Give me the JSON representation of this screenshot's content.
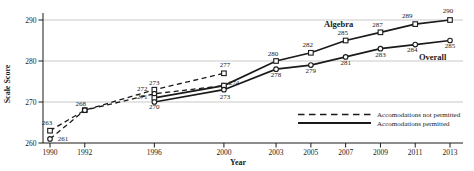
{
  "figure": {
    "background": "#ffffff",
    "text_color": "#1a1a1a",
    "line_color": "#1a1a1a",
    "grid_color": "#bbbbbb"
  },
  "chart_data": {
    "type": "line",
    "title": "",
    "xlabel": "Year",
    "ylabel": "Scale Score",
    "xlim": [
      1990,
      2013
    ],
    "ylim": [
      260,
      290
    ],
    "x_ticks": [
      1990,
      1992,
      1996,
      2000,
      2003,
      2005,
      2007,
      2009,
      2011,
      2013
    ],
    "y_ticks": [
      260,
      270,
      280,
      290
    ],
    "grid": "horizontal-y",
    "legend": {
      "position": "inside-bottom-right",
      "entries": [
        {
          "style": "dashed",
          "label": "Accomodations not permitted"
        },
        {
          "style": "solid",
          "label": "Accomodations permitted"
        }
      ]
    },
    "annotations": [
      {
        "text": "Algebra",
        "x": 2006.6,
        "y": 289.0
      },
      {
        "text": "Overall",
        "x": 2012.0,
        "y": 281.0
      }
    ],
    "series": [
      {
        "name": "Algebra (accommodations not permitted)",
        "group": "Algebra",
        "accommodations": "not permitted",
        "line": "dashed",
        "marker": "square",
        "points": [
          {
            "x": 1990,
            "y": 263,
            "label": "263",
            "dx": -3,
            "dy": -6
          },
          {
            "x": 1992,
            "y": 268,
            "label": "268",
            "dx": -4,
            "dy": -4
          },
          {
            "x": 1996,
            "y": 273,
            "label": "273",
            "dx": 0,
            "dy": -5
          },
          {
            "x": 2000,
            "y": 277,
            "label": "277",
            "dx": 1,
            "dy": -6
          }
        ]
      },
      {
        "name": "Overall (accommodations not permitted)",
        "group": "Overall",
        "accommodations": "not permitted",
        "line": "dashed",
        "marker": "circle",
        "points": [
          {
            "x": 1990,
            "y": 261,
            "label": "261",
            "dx": 13,
            "dy": 2
          },
          {
            "x": 1992,
            "y": 268,
            "label": null
          },
          {
            "x": 1996,
            "y": 272,
            "label": "272",
            "dx": -12,
            "dy": -3
          },
          {
            "x": 2000,
            "y": 274,
            "label": null
          }
        ]
      },
      {
        "name": "Algebra (accommodations permitted)",
        "group": "Algebra",
        "accommodations": "permitted",
        "line": "solid",
        "marker": "square",
        "points": [
          {
            "x": 1996,
            "y": 271,
            "label": "271",
            "dx": -12,
            "dy": 1
          },
          {
            "x": 2000,
            "y": 274,
            "label": "274",
            "dx": 10,
            "dy": -1
          },
          {
            "x": 2003,
            "y": 280,
            "label": "280",
            "dx": -3,
            "dy": -5
          },
          {
            "x": 2005,
            "y": 282,
            "label": "282",
            "dx": -3,
            "dy": -6
          },
          {
            "x": 2007,
            "y": 285,
            "label": "285",
            "dx": -3,
            "dy": -6
          },
          {
            "x": 2009,
            "y": 287,
            "label": "287",
            "dx": -3,
            "dy": -5
          },
          {
            "x": 2011,
            "y": 289,
            "label": "289",
            "dx": -8,
            "dy": -6
          },
          {
            "x": 2013,
            "y": 290,
            "label": "290",
            "dx": -2,
            "dy": -7
          }
        ]
      },
      {
        "name": "Overall (accommodations permitted)",
        "group": "Overall",
        "accommodations": "permitted",
        "line": "solid",
        "marker": "circle",
        "points": [
          {
            "x": 1996,
            "y": 270,
            "label": "270",
            "dx": 0,
            "dy": 7
          },
          {
            "x": 2000,
            "y": 273,
            "label": "273",
            "dx": 1,
            "dy": 9
          },
          {
            "x": 2003,
            "y": 278,
            "label": "278",
            "dx": 0,
            "dy": 8
          },
          {
            "x": 2005,
            "y": 279,
            "label": "279",
            "dx": 0,
            "dy": 8
          },
          {
            "x": 2007,
            "y": 281,
            "label": "281",
            "dx": 0,
            "dy": 8
          },
          {
            "x": 2009,
            "y": 283,
            "label": "283",
            "dx": 0,
            "dy": 8
          },
          {
            "x": 2011,
            "y": 284,
            "label": "284",
            "dx": -3,
            "dy": 7
          },
          {
            "x": 2013,
            "y": 285,
            "label": "285",
            "dx": 0,
            "dy": 7
          }
        ]
      }
    ]
  }
}
